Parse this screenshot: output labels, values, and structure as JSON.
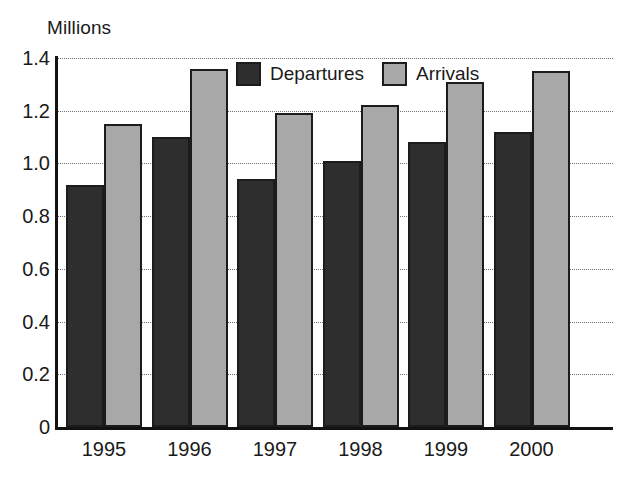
{
  "chart_data": {
    "type": "bar",
    "title": "",
    "ylabel": "Millions",
    "xlabel": "",
    "categories": [
      "1995",
      "1996",
      "1997",
      "1998",
      "1999",
      "2000"
    ],
    "series": [
      {
        "name": "Departures",
        "color": "#2e2e2e",
        "values": [
          0.92,
          1.1,
          0.94,
          1.01,
          1.08,
          1.12
        ]
      },
      {
        "name": "Arrivals",
        "color": "#a8a8a8",
        "values": [
          1.15,
          1.36,
          1.19,
          1.22,
          1.31,
          1.35
        ]
      }
    ],
    "ylim": [
      0,
      1.4
    ],
    "ytick_labels": [
      "0",
      "0.2",
      "0.4",
      "0.6",
      "0.8",
      "1.0",
      "1.2",
      "1.4"
    ],
    "ytick_values": [
      0,
      0.2,
      0.4,
      0.6,
      0.8,
      1.0,
      1.2,
      1.4
    ],
    "grid": true,
    "grid_style": "dotted",
    "legend_position": "top-center",
    "legend": [
      "Departures",
      "Arrivals"
    ]
  }
}
